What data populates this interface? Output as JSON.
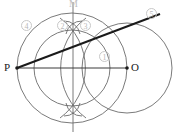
{
  "figure": {
    "points": [
      {
        "id": "P",
        "label": "P",
        "x": 17,
        "y": 68,
        "marker": true
      },
      {
        "id": "O",
        "label": "O",
        "x": 127,
        "y": 68,
        "marker": true
      },
      {
        "id": "M",
        "label": "M",
        "x": 73,
        "y": 5,
        "marker": false
      }
    ],
    "steps": [
      {
        "id": "step-1",
        "label": "1"
      },
      {
        "id": "step-2",
        "label": "2"
      },
      {
        "id": "step-3",
        "label": "3"
      },
      {
        "id": "step-4",
        "label": "4"
      },
      {
        "id": "step-5",
        "label": "5"
      }
    ],
    "colors": {
      "stroke_thin": "#6b6b6b",
      "stroke_thick": "#1a1a1a",
      "label_faint": "#b9b9b9",
      "background": "#ffffff"
    },
    "geometry": {
      "circle_O": {
        "cx": 127,
        "cy": 68,
        "r": 45
      },
      "circle_mid": {
        "cx": 72,
        "cy": 68,
        "r": 55
      },
      "arc_left": {
        "cx": 17,
        "cy": 68,
        "r": 62
      },
      "line_PO": {
        "x1": 17,
        "y1": 68,
        "x2": 127,
        "y2": 68
      },
      "line_vertical": {
        "x1": 73,
        "y1": 2,
        "x2": 73,
        "y2": 132
      },
      "tangent_line": {
        "x1": 17,
        "y1": 68,
        "x2": 160,
        "y2": 14
      }
    }
  }
}
